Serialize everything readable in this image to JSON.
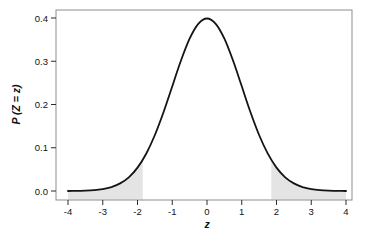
{
  "figure": {
    "background": "#ffffff"
  },
  "chart_data": {
    "type": "area",
    "subtype": "normal-distribution-pdf-with-shaded-tails",
    "title": "",
    "xlabel": "z",
    "ylabel": "P (Z = z)",
    "xlim": [
      -4,
      4
    ],
    "ylim": [
      0,
      0.4
    ],
    "grid": false,
    "legend": null,
    "x_ticks": [
      -4,
      -3,
      -2,
      -1,
      0,
      1,
      2,
      3,
      4
    ],
    "x_tick_labels": [
      "-4",
      "-3",
      "-2",
      "-1",
      "0",
      "1",
      "2",
      "3",
      "4"
    ],
    "y_ticks": [
      0,
      0.1,
      0.2,
      0.3,
      0.4
    ],
    "y_tick_labels": [
      "0.0",
      "0.1",
      "0.2",
      "0.3",
      "0.4"
    ],
    "curve": {
      "name": "standard-normal-pdf",
      "formula": "P(Z=z) = exp(-z^2/2) / sqrt(2*pi)",
      "peak": {
        "z": 0,
        "p": 0.3989
      },
      "points": [
        [
          -4,
          0.0001
        ],
        [
          -3.75,
          0.0004
        ],
        [
          -3.5,
          0.0009
        ],
        [
          -3.25,
          0.002
        ],
        [
          -3,
          0.0044
        ],
        [
          -2.75,
          0.0091
        ],
        [
          -2.5,
          0.0175
        ],
        [
          -2.25,
          0.0317
        ],
        [
          -2,
          0.054
        ],
        [
          -1.75,
          0.0863
        ],
        [
          -1.5,
          0.1295
        ],
        [
          -1.25,
          0.1826
        ],
        [
          -1,
          0.242
        ],
        [
          -0.75,
          0.3011
        ],
        [
          -0.5,
          0.3521
        ],
        [
          -0.25,
          0.3867
        ],
        [
          0,
          0.3989
        ],
        [
          0.25,
          0.3867
        ],
        [
          0.5,
          0.3521
        ],
        [
          0.75,
          0.3011
        ],
        [
          1,
          0.242
        ],
        [
          1.25,
          0.1826
        ],
        [
          1.5,
          0.1295
        ],
        [
          1.75,
          0.0863
        ],
        [
          2,
          0.054
        ],
        [
          2.25,
          0.0317
        ],
        [
          2.5,
          0.0175
        ],
        [
          2.75,
          0.0091
        ],
        [
          3,
          0.0044
        ],
        [
          3.25,
          0.002
        ],
        [
          3.5,
          0.0009
        ],
        [
          3.75,
          0.0004
        ],
        [
          4,
          0.0001
        ]
      ]
    },
    "shaded_regions": [
      {
        "name": "lower-tail-shade",
        "from": -4,
        "to": -1.85
      },
      {
        "name": "upper-tail-shade",
        "from": 1.85,
        "to": 4
      }
    ],
    "style": {
      "curve_color": "#141414",
      "curve_width": 1.8,
      "shade_fill": "#e4e4e4",
      "box_stroke": "#8d8d8d",
      "tick_color": "#2b2b2b",
      "label_color": "#111111"
    }
  }
}
